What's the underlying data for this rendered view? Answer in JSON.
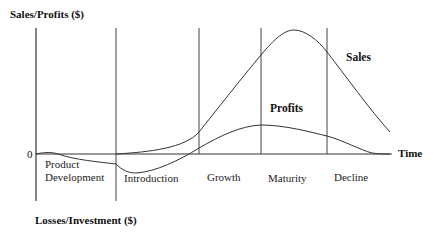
{
  "diagram": {
    "y_axis_top_label": "Sales/Profits ($)",
    "y_axis_bottom_label": "Losses/Investment ($)",
    "x_axis_label": "Time",
    "zero_label": "0",
    "curves": {
      "sales_label": "Sales",
      "profits_label": "Profits"
    },
    "stages": [
      {
        "label_line1": "Product",
        "label_line2": "Development"
      },
      {
        "label": "Introduction"
      },
      {
        "label": "Growth"
      },
      {
        "label": "Maturity"
      },
      {
        "label": "Decline"
      }
    ],
    "colors": {
      "line": "#333333",
      "text": "#111111",
      "background": "#ffffff"
    }
  }
}
